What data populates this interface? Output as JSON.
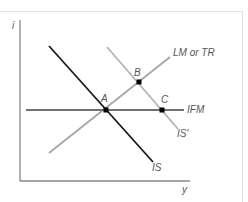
{
  "diagram": {
    "title": "",
    "axes": {
      "y_label": "i",
      "x_label": "y",
      "color": "#888888"
    },
    "curves": [
      {
        "id": "IS",
        "label": "IS",
        "color": "#1a1a1a",
        "from": [
          49,
          46
        ],
        "to": [
          153,
          162
        ]
      },
      {
        "id": "LM",
        "label": "LM or TR",
        "color": "#a6a6a6",
        "from": [
          49,
          153
        ],
        "to": [
          170,
          57
        ]
      },
      {
        "id": "IFM",
        "label": "IFM",
        "color": "#707070",
        "from": [
          26,
          110
        ],
        "to": [
          184,
          110
        ]
      },
      {
        "id": "IS_prime",
        "label": "IS′",
        "color": "#b3b3b3",
        "from": [
          107,
          47
        ],
        "to": [
          178,
          129
        ]
      }
    ],
    "points": [
      {
        "id": "A",
        "label": "A",
        "x": 106,
        "y": 110
      },
      {
        "id": "B",
        "label": "B",
        "x": 139,
        "y": 82
      },
      {
        "id": "C",
        "label": "C",
        "x": 162,
        "y": 110
      }
    ],
    "point_color": "#000000",
    "frame_color": "#e2e2e2"
  }
}
